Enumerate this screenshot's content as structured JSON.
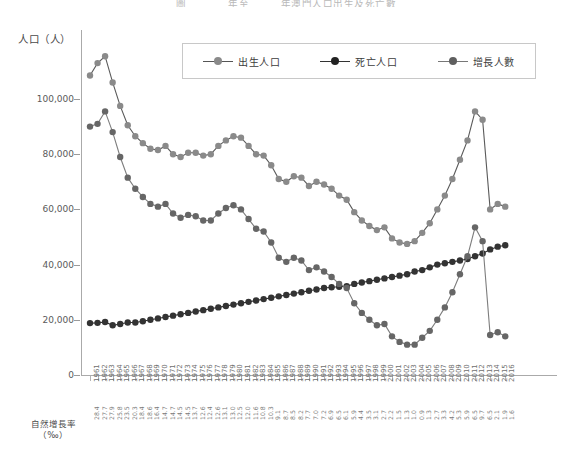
{
  "title": "圖　　　　年至　　　年澳門人口出生及死亡數",
  "legend": {
    "items": [
      {
        "label": "出生人口",
        "color": "#8a8a8a",
        "name": "births"
      },
      {
        "label": "死亡人口",
        "color": "#333333",
        "name": "deaths"
      },
      {
        "label": "增長人數",
        "color": "#666666",
        "name": "growth"
      }
    ]
  },
  "yaxis": {
    "title": "人口（人）",
    "ticks": [
      "0",
      "20,000",
      "40,000",
      "60,000",
      "80,000",
      "100,000"
    ],
    "min": 0,
    "max": 120000
  },
  "rate_axis": {
    "title_line1": "自然增長率",
    "title_line2": "（‰）"
  },
  "chart_data": {
    "type": "line",
    "title": "圖　　　　年至　　　年澳門人口出生及死亡數",
    "xlabel": "",
    "ylabel": "人口（人）",
    "ylim": [
      0,
      120000
    ],
    "grid": false,
    "legend_position": "top-center",
    "x": [
      "1961",
      "1962",
      "1963",
      "1964",
      "1965",
      "1966",
      "1967",
      "1968",
      "1969",
      "1970",
      "1971",
      "1972",
      "1973",
      "1974",
      "1975",
      "1976",
      "1977",
      "1978",
      "1979",
      "1980",
      "1981",
      "1982",
      "1983",
      "1984",
      "1985",
      "1986",
      "1987",
      "1988",
      "1989",
      "1990",
      "1991",
      "1992",
      "1993",
      "1994",
      "1995",
      "1996",
      "1997",
      "1998",
      "1999",
      "2000",
      "2001",
      "2002",
      "2003",
      "2004",
      "2005",
      "2006",
      "2007",
      "2008",
      "2009",
      "2010",
      "2011",
      "2012",
      "2013",
      "2014",
      "2015",
      "2016"
    ],
    "natural_growth_rate": [
      "28.4",
      "27.7",
      "27.9",
      "25.8",
      "23.5",
      "20.3",
      "18.4",
      "18.6",
      "16.4",
      "14.7",
      "14.7",
      "14.5",
      "14.5",
      "13.7",
      "12.6",
      "12.4",
      "12.6",
      "13.1",
      "13.0",
      "12.5",
      "12.0",
      "11.6",
      "10.8",
      "10.3",
      "9.1",
      "8.7",
      "8.5",
      "8.2",
      "7.7",
      "7.0",
      "7.2",
      "6.9",
      "6.5",
      "6.1",
      "5.9",
      "4.4",
      "3.5",
      "3.1",
      "2.7",
      "2.2",
      "1.5",
      "1.3",
      "1.0",
      "0.9",
      "1.3",
      "2.7",
      "3.3",
      "4.2",
      "5.3",
      "5.9",
      "6.5",
      "9.7",
      "6.5",
      "2.1",
      "1.9",
      "1.6"
    ],
    "series": [
      {
        "name": "出生人口",
        "color": "#8a8a8a",
        "values": [
          108500,
          113000,
          115500,
          106000,
          97500,
          90500,
          86500,
          84000,
          82000,
          81500,
          83000,
          80000,
          79000,
          80500,
          80500,
          79500,
          80000,
          83000,
          85000,
          86500,
          86000,
          83000,
          80000,
          79500,
          76000,
          71000,
          70000,
          72000,
          71500,
          68500,
          70000,
          69000,
          67500,
          65000,
          63500,
          59000,
          56000,
          54000,
          52500,
          53500,
          49500,
          48000,
          47500,
          48500,
          51500,
          55000,
          60000,
          65000,
          71000,
          78000,
          85000,
          95500,
          92500,
          60000,
          62000,
          61000
        ]
      },
      {
        "name": "死亡人口",
        "color": "#333333",
        "values": [
          18800,
          18900,
          19200,
          18000,
          18500,
          19000,
          19000,
          19500,
          20000,
          20500,
          21000,
          21500,
          22000,
          22500,
          23000,
          23500,
          24000,
          24500,
          25000,
          25500,
          26000,
          26500,
          27000,
          27500,
          28000,
          28500,
          29000,
          29500,
          30000,
          30500,
          31000,
          31500,
          31800,
          32000,
          32200,
          33000,
          33500,
          34000,
          34500,
          35000,
          35500,
          36000,
          36500,
          37500,
          38000,
          39000,
          40000,
          40500,
          41000,
          41500,
          42000,
          43000,
          44000,
          45500,
          46500,
          47000
        ]
      },
      {
        "name": "增長人數",
        "color": "#666666",
        "values": [
          90000,
          91000,
          95500,
          88000,
          79000,
          71500,
          67500,
          64500,
          62000,
          61000,
          62000,
          58500,
          57000,
          58000,
          57500,
          56000,
          56000,
          58500,
          60500,
          61500,
          60000,
          56500,
          53000,
          52000,
          48000,
          42500,
          41000,
          42500,
          41500,
          38000,
          39000,
          37500,
          35500,
          33000,
          31500,
          26000,
          22500,
          20000,
          18000,
          18500,
          14000,
          12000,
          11000,
          11000,
          13500,
          16000,
          20000,
          24500,
          30000,
          36500,
          43000,
          53500,
          48500,
          14500,
          15500,
          14000
        ]
      }
    ]
  }
}
